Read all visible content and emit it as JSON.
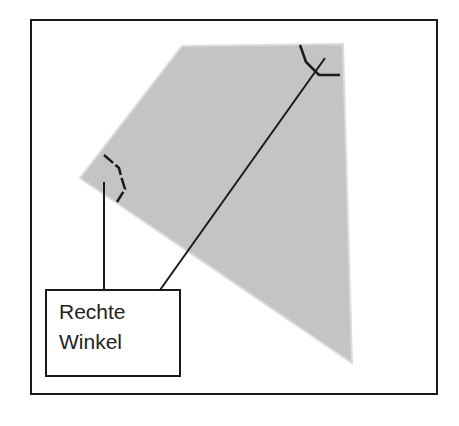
{
  "diagram": {
    "label": {
      "line1": "Rechte",
      "line2": "Winkel"
    },
    "colors": {
      "shape_fill": "#c4c4c4",
      "stroke": "#1a1a1a",
      "background": "#ffffff"
    },
    "shape": {
      "type": "quadrilateral",
      "vertices": [
        [
          182,
          46
        ],
        [
          343,
          44
        ],
        [
          352,
          363
        ],
        [
          80,
          178
        ]
      ]
    },
    "right_angle_markers": 2
  }
}
